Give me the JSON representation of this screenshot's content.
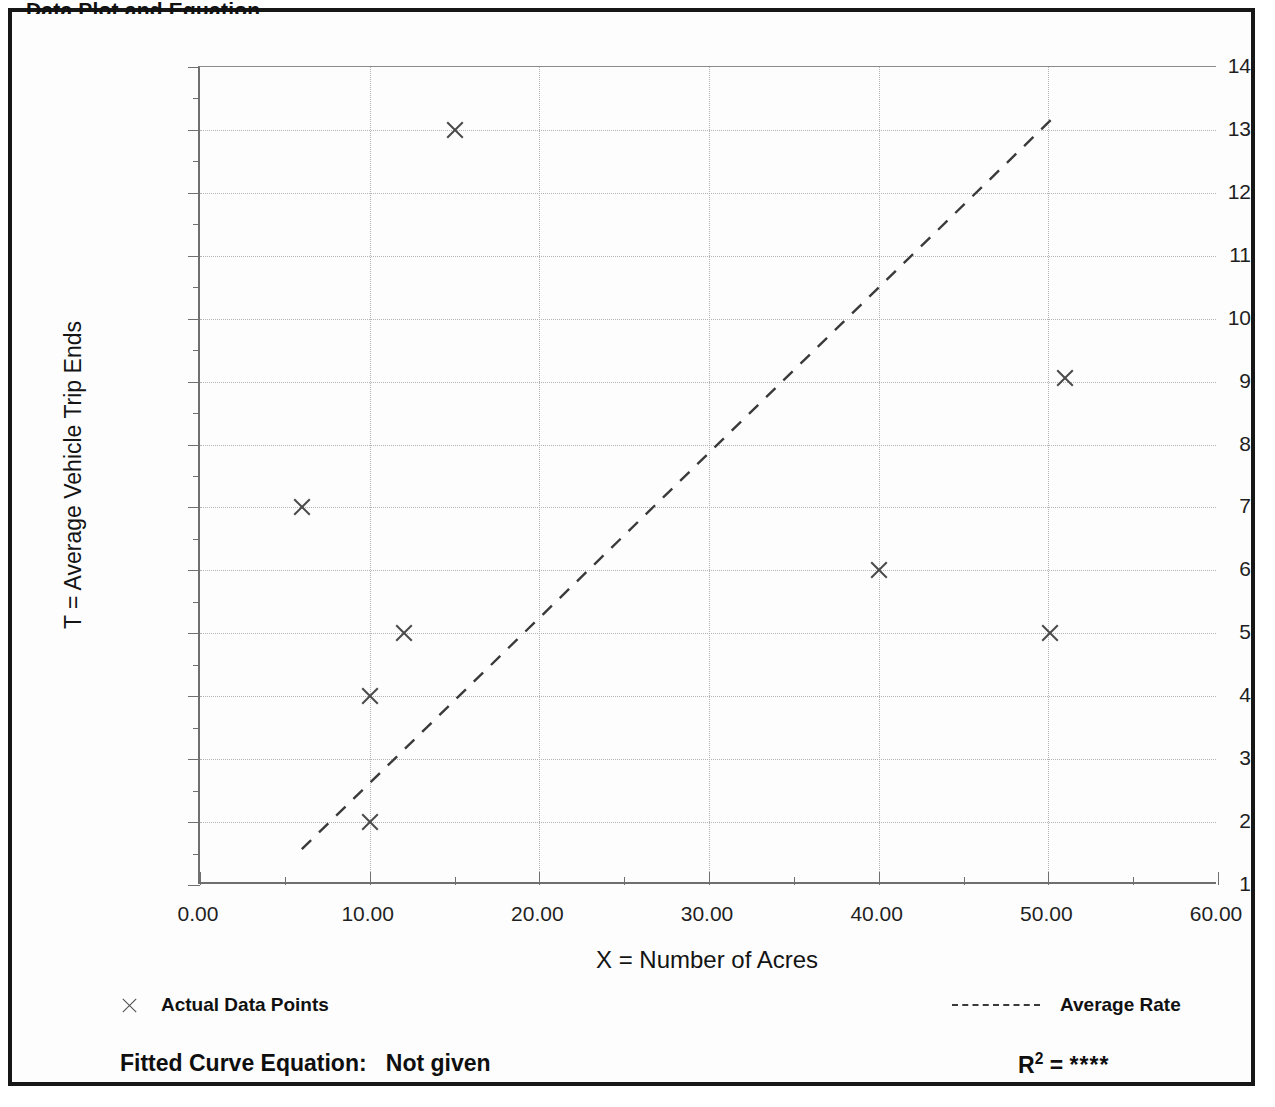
{
  "page": {
    "clipped_title": "Data Plot and Equation",
    "frame_color": "#171717",
    "background": "#ffffff"
  },
  "chart_data": {
    "type": "scatter",
    "title": "",
    "xlabel": "X = Number of Acres",
    "ylabel": "T = Average Vehicle Trip Ends",
    "xlim": [
      0,
      60
    ],
    "ylim": [
      1,
      14
    ],
    "grid": true,
    "x_ticks": [
      0,
      10,
      20,
      30,
      40,
      50,
      60
    ],
    "x_tick_labels": [
      "0.00",
      "10.00",
      "20.00",
      "30.00",
      "40.00",
      "50.00",
      "60.00"
    ],
    "x_minor_step": 5,
    "y_ticks": [
      1,
      2,
      3,
      4,
      5,
      6,
      7,
      8,
      9,
      10,
      11,
      12,
      13,
      14
    ],
    "y_tick_labels": [
      "1",
      "2",
      "3",
      "4",
      "5",
      "6",
      "7",
      "8",
      "9",
      "10",
      "11",
      "12",
      "13",
      "14"
    ],
    "y_minor_step": 0.5,
    "series": [
      {
        "name": "Actual Data Points",
        "type": "scatter",
        "marker": "x",
        "color": "#4a4a4a",
        "points": [
          {
            "x": 6,
            "y": 7
          },
          {
            "x": 10,
            "y": 4
          },
          {
            "x": 10,
            "y": 2
          },
          {
            "x": 12,
            "y": 5
          },
          {
            "x": 15,
            "y": 13
          },
          {
            "x": 40,
            "y": 6
          },
          {
            "x": 50.1,
            "y": 5
          },
          {
            "x": 51,
            "y": 9.05
          }
        ]
      },
      {
        "name": "Average Rate",
        "type": "line",
        "style": "dashed",
        "color": "#3a3a3a",
        "endpoints": [
          {
            "x": 6.0,
            "y": 1.57
          },
          {
            "x": 50.5,
            "y": 13.25
          }
        ]
      }
    ],
    "legend_position": "below-plot",
    "legend": [
      {
        "label": "Actual Data Points",
        "marker": "x"
      },
      {
        "label": "Average Rate",
        "marker": "dashed-line"
      }
    ],
    "annotations": {
      "fitted_curve_label": "Fitted Curve Equation:",
      "fitted_curve_value": "Not given",
      "r_squared_label": "R",
      "r_squared_exponent": "2",
      "r_squared_equals": "=",
      "r_squared_value": "****"
    }
  }
}
